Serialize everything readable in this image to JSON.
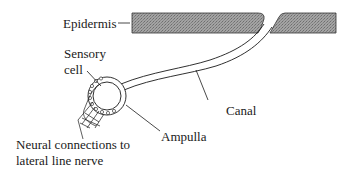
{
  "diagram": {
    "labels": {
      "epidermis": "Epidermis",
      "sensory_cell_line1": "Sensory",
      "sensory_cell_line2": "cell",
      "canal": "Canal",
      "ampulla": "Ampulla",
      "neural_line1": "Neural connections to",
      "neural_line2": "lateral line nerve"
    },
    "colors": {
      "ink": "#1a1a1a",
      "epidermis_fill": "#9a9a9a",
      "background": "#ffffff"
    }
  }
}
